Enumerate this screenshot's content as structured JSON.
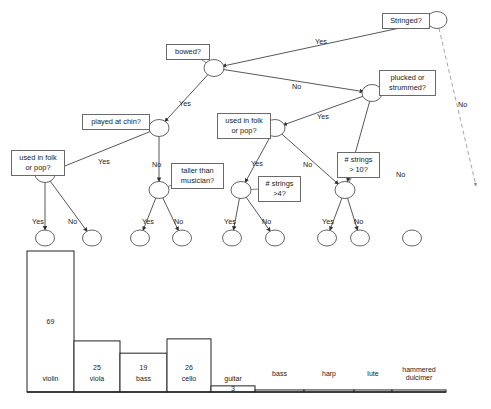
{
  "diagram": {
    "nodes": [
      {
        "id": "root",
        "label": "Stringed?",
        "cx": 437,
        "cy": 20,
        "box_x": 382,
        "box_y": 13,
        "box_w": 48,
        "box_h": 13
      },
      {
        "id": "bowed",
        "label": "bowed?",
        "cx": 214,
        "cy": 68,
        "box_x": 166,
        "box_y": 44,
        "box_w": 44,
        "box_h": 13
      },
      {
        "id": "plucked",
        "label": "plucked or\nstrummed?",
        "cx": 372,
        "cy": 93,
        "box_x": 379,
        "box_y": 70,
        "box_w": 57,
        "box_h": 24
      },
      {
        "id": "chin",
        "label": "played at chin?",
        "cx": 159,
        "cy": 128,
        "box_x": 82,
        "box_y": 114,
        "box_w": 68,
        "box_h": 13
      },
      {
        "id": "folk1",
        "label": "used in folk\nor pop?",
        "cx": 45,
        "cy": 174,
        "box_x": 11,
        "box_y": 150,
        "box_w": 54,
        "box_h": 24
      },
      {
        "id": "taller",
        "label": "taller than\nmusician?",
        "cx": 159,
        "cy": 190,
        "box_x": 171,
        "box_y": 163,
        "box_w": 53,
        "box_h": 24
      },
      {
        "id": "folk2",
        "label": "used in folk\nor pop?",
        "cx": 275,
        "cy": 128,
        "box_x": 217,
        "box_y": 113,
        "box_w": 54,
        "box_h": 24
      },
      {
        "id": "strings4",
        "label": "# strings\n>4?",
        "cx": 241,
        "cy": 190,
        "box_x": 258,
        "box_y": 176,
        "box_w": 43,
        "box_h": 24
      },
      {
        "id": "strings10",
        "label": "# strings\n> 10?",
        "cx": 345,
        "cy": 190,
        "box_x": 337,
        "box_y": 152,
        "box_w": 43,
        "box_h": 24
      }
    ],
    "leaves": [
      {
        "id": "leaf-violin",
        "cx": 45,
        "cy": 238
      },
      {
        "id": "leaf-viola",
        "cx": 92,
        "cy": 238
      },
      {
        "id": "leaf-bass",
        "cx": 140,
        "cy": 238
      },
      {
        "id": "leaf-cello",
        "cx": 182,
        "cy": 238
      },
      {
        "id": "leaf-guitar",
        "cx": 232,
        "cy": 238
      },
      {
        "id": "leaf-bass2",
        "cx": 275,
        "cy": 238
      },
      {
        "id": "leaf-harp",
        "cx": 327,
        "cy": 238
      },
      {
        "id": "leaf-lute",
        "cx": 360,
        "cy": 238
      },
      {
        "id": "leaf-dulcimer",
        "cx": 412,
        "cy": 238
      }
    ],
    "edges": [
      {
        "from": "root",
        "to": "bowed",
        "label": "Yes",
        "lx": 315,
        "ly": 37,
        "style": "solid"
      },
      {
        "from": "root",
        "to": "none",
        "label": "No",
        "lx": 458,
        "ly": 100,
        "style": "dashed"
      },
      {
        "from": "bowed",
        "to": "chin",
        "label": "Yes",
        "lx": 179,
        "ly": 99,
        "style": "solid"
      },
      {
        "from": "bowed",
        "to": "plucked",
        "label": "No",
        "lx": 292,
        "ly": 82,
        "style": "solid"
      },
      {
        "from": "chin",
        "to": "folk1",
        "label": "Yes",
        "lx": 98,
        "ly": 157,
        "style": "solid"
      },
      {
        "from": "chin",
        "to": "taller",
        "label": "No",
        "lx": 152,
        "ly": 160,
        "style": "solid"
      },
      {
        "from": "plucked",
        "to": "folk2",
        "label": "Yes",
        "lx": 317,
        "ly": 112,
        "style": "solid"
      },
      {
        "from": "plucked",
        "to": "strings10",
        "label": "No",
        "lx": 396,
        "ly": 170,
        "style": "solid"
      },
      {
        "from": "folk2",
        "to": "strings4",
        "label": "Yes",
        "lx": 251,
        "ly": 159,
        "style": "solid"
      },
      {
        "from": "folk2",
        "to": "strings10",
        "label": "No",
        "lx": 303,
        "ly": 160,
        "style": "solid"
      },
      {
        "from": "folk1",
        "to": "leaf-violin",
        "label": "Yes",
        "lx": 32,
        "ly": 217,
        "style": "solid"
      },
      {
        "from": "folk1",
        "to": "leaf-viola",
        "label": "No",
        "lx": 68,
        "ly": 217,
        "style": "solid"
      },
      {
        "from": "taller",
        "to": "leaf-bass",
        "label": "Yes",
        "lx": 142,
        "ly": 217,
        "style": "solid"
      },
      {
        "from": "taller",
        "to": "leaf-cello",
        "label": "No",
        "lx": 174,
        "ly": 217,
        "style": "solid"
      },
      {
        "from": "strings4",
        "to": "leaf-guitar",
        "label": "Yes",
        "lx": 224,
        "ly": 217,
        "style": "solid"
      },
      {
        "from": "strings4",
        "to": "leaf-bass2",
        "label": "No",
        "lx": 262,
        "ly": 217,
        "style": "solid"
      },
      {
        "from": "strings10",
        "to": "leaf-harp",
        "label": "Yes",
        "lx": 322,
        "ly": 217,
        "style": "solid"
      },
      {
        "from": "strings10",
        "to": "leaf-lute",
        "label": "No",
        "lx": 354,
        "ly": 217,
        "style": "solid"
      }
    ]
  },
  "chart_data": {
    "type": "bar",
    "title": "",
    "xlabel": "",
    "ylabel": "",
    "ylim": [
      0,
      69
    ],
    "grid": false,
    "categories": [
      "violin",
      "viola",
      "bass",
      "cello",
      "guitar",
      "bass",
      "harp",
      "lute",
      "hammered\ndulcimer"
    ],
    "values": [
      69,
      25,
      19,
      26,
      3,
      1,
      1,
      1,
      1
    ],
    "value_labels": [
      "69",
      "25",
      "19",
      "26",
      "3",
      "",
      "",
      "",
      ""
    ],
    "bars": [
      {
        "label": "violin",
        "value": 69,
        "x": 27,
        "w": 47,
        "show_value": true
      },
      {
        "label": "viola",
        "value": 25,
        "x": 74,
        "w": 46,
        "show_value": true
      },
      {
        "label": "bass",
        "value": 19,
        "x": 120,
        "w": 47,
        "show_value": true
      },
      {
        "label": "cello",
        "value": 26,
        "x": 167,
        "w": 44,
        "show_value": true
      },
      {
        "label": "guitar",
        "value": 3,
        "x": 211,
        "w": 44,
        "show_value": true
      },
      {
        "label": "bass",
        "value": 1,
        "x": 255,
        "w": 49,
        "show_value": false
      },
      {
        "label": "harp",
        "value": 1,
        "x": 304,
        "w": 50,
        "show_value": false
      },
      {
        "label": "lute",
        "value": 1,
        "x": 354,
        "w": 38,
        "show_value": false
      },
      {
        "label": "hammered dulcimer",
        "value": 1,
        "x": 392,
        "w": 54,
        "show_value": false
      }
    ]
  }
}
